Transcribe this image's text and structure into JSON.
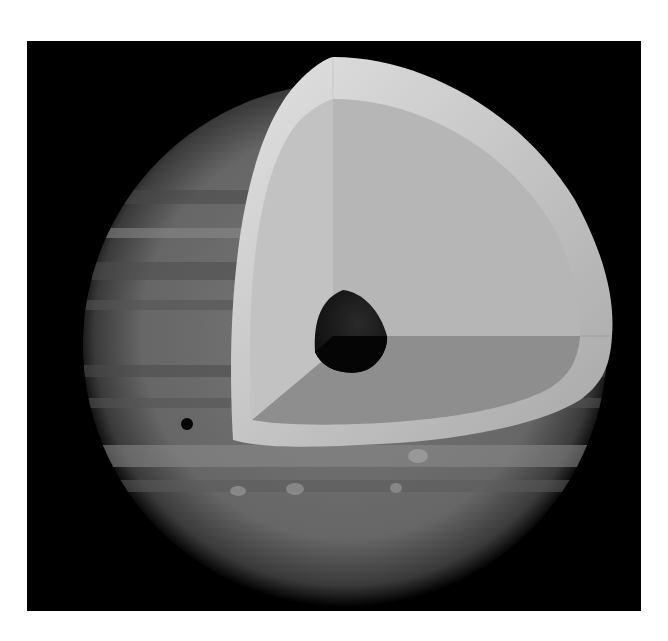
{
  "figure": {
    "labels": []
  },
  "colors": {
    "background": "#000000",
    "page": "#ffffff",
    "planet_surface": "#6e6e6e",
    "outer_shell_light": "#d8d8d8",
    "outer_shell_dark": "#9a9a9a",
    "mantle_face_left": "#bdbdbd",
    "mantle_face_right": "#b4b4b4",
    "mantle_face_bottom": "#8a8a8a",
    "core": "#1a1a1a",
    "moon_shadow": "#050505"
  },
  "layers": [
    {
      "name": "outer-shell"
    },
    {
      "name": "mantle"
    },
    {
      "name": "core"
    }
  ]
}
